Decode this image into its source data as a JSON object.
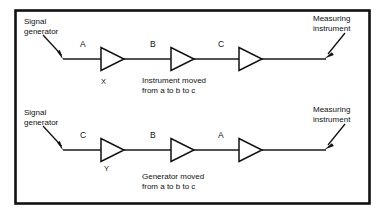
{
  "figure": {
    "border_color": "#111111",
    "line_color": "#1a1a1a",
    "text_color": "#111111"
  },
  "diagram_data": {
    "type": "block-diagram",
    "rows": [
      {
        "id": "top",
        "source_label": "Signal\ngenerator",
        "sink_label": "Measuring\ninstrument",
        "blocks": [
          "A",
          "B",
          "C"
        ],
        "marker": "X",
        "caption": "Instrument moved\nfrom a to b to c"
      },
      {
        "id": "bottom",
        "source_label": "Signal\ngenerator",
        "sink_label": "Measuring\ninstrument",
        "blocks": [
          "C",
          "B",
          "A"
        ],
        "marker": "Y",
        "caption": "Generator moved\nfrom a to b to c"
      }
    ]
  },
  "top": {
    "source_line1": "Signal",
    "source_line2": "generator",
    "sink_line1": "Measuring",
    "sink_line2": "instrument",
    "block_a": "A",
    "block_b": "B",
    "block_c": "C",
    "marker": "X",
    "caption_line1": "Instrument moved",
    "caption_line2": "from a to b to c"
  },
  "bottom": {
    "source_line1": "Signal",
    "source_line2": "generator",
    "sink_line1": "Measuring",
    "sink_line2": "instrument",
    "block_a": "C",
    "block_b": "B",
    "block_c": "A",
    "marker": "Y",
    "caption_line1": "Generator moved",
    "caption_line2": "from a to b to c"
  }
}
